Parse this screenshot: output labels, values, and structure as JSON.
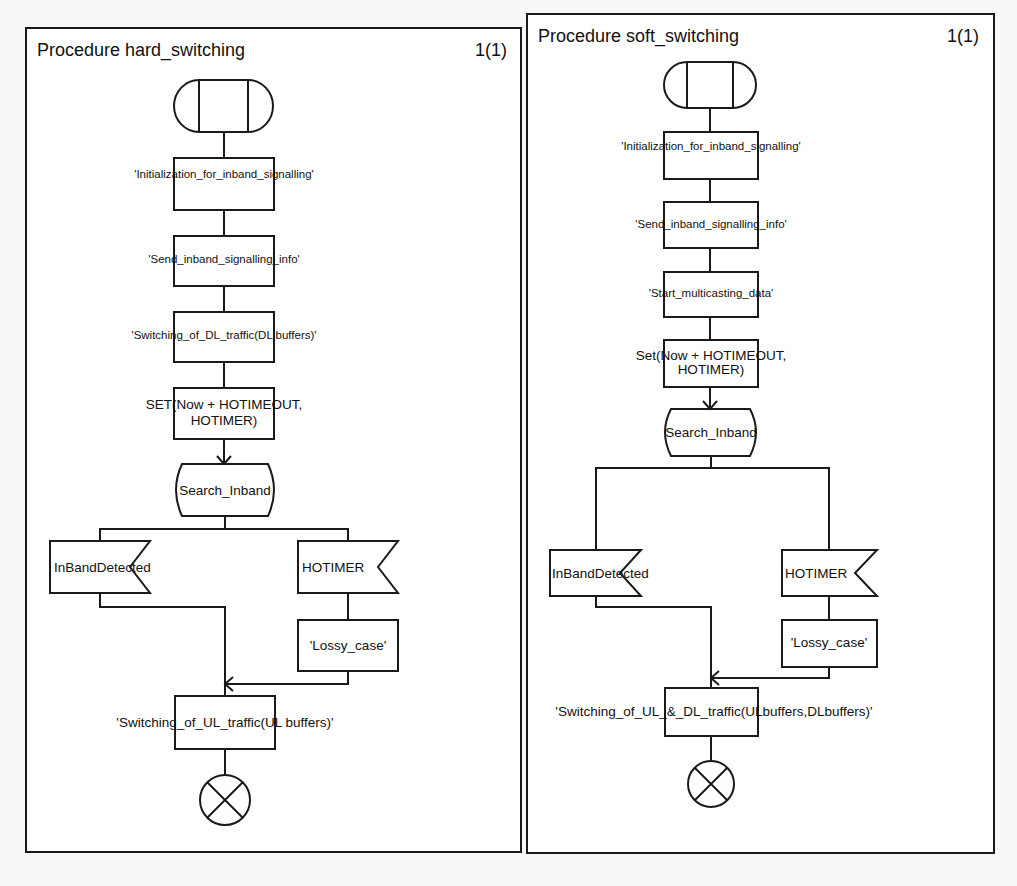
{
  "colors": {
    "ink": "#1a1a1a",
    "paper": "#ffffff",
    "background": "#f7f7f5"
  },
  "panels": [
    {
      "title": "Procedure hard_switching",
      "page": "1(1)",
      "symbols": {
        "start": {
          "type": "procedure-start",
          "icon": "procedure-start-icon"
        },
        "task1": "'Initialization_for_inband_signalling'",
        "task2": "'Send_inband_signalling_info'",
        "task3": "'Switching_of_DL_traffic(DL buffers)'",
        "timer_line1": "SET(Now + HOTIMEOUT,",
        "timer_line2": "HOTIMER)",
        "state": "Search_Inband",
        "input_left": "InBandDetected",
        "input_right": "HOTIMER",
        "task_lossy": "'Lossy_case'",
        "task_final": "'Switching_of_UL_traffic(UL buffers)'",
        "end": {
          "type": "procedure-return",
          "icon": "return-icon"
        }
      }
    },
    {
      "title": "Procedure soft_switching",
      "page": "1(1)",
      "symbols": {
        "start": {
          "type": "procedure-start",
          "icon": "procedure-start-icon"
        },
        "task1": "'Initialization_for_inband_signalling'",
        "task2": "'Send_inband_signalling_info'",
        "task3": "'Start_multicasting_data'",
        "timer_line1": "Set(Now + HOTIMEOUT,",
        "timer_line2": "HOTIMER)",
        "state": "Search_Inband",
        "input_left": "InBandDetected",
        "input_right": "HOTIMER",
        "task_lossy": "'Lossy_case'",
        "task_final": "'Switching_of_UL_&_DL_traffic(ULbuffers,DLbuffers)'",
        "end": {
          "type": "procedure-return",
          "icon": "return-icon"
        }
      }
    }
  ]
}
